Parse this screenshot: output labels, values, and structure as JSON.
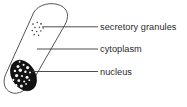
{
  "figure": {
    "background_color": "#ffffff",
    "line_color": "#555555",
    "text_color": "#2b2b2b"
  },
  "cell": {
    "name": "secretory cell",
    "shape": "capsule",
    "outline_color": "#555555"
  },
  "structures": {
    "granules": {
      "name": "secretory granules",
      "color": "#3c3c3c",
      "count": 11
    },
    "cytoplasm": {
      "name": "cytoplasm",
      "color": "#ffffff"
    },
    "nucleus": {
      "name": "nucleus",
      "color": "#121212",
      "speckle_color": "#f2f2f2"
    }
  },
  "labels": [
    {
      "id": "secretory-granules",
      "text": "secretory granules",
      "x": 100,
      "y": 30
    },
    {
      "id": "cytoplasm",
      "text": "cytoplasm",
      "x": 100,
      "y": 52
    },
    {
      "id": "nucleus",
      "text": "nucleus",
      "x": 100,
      "y": 75
    }
  ]
}
